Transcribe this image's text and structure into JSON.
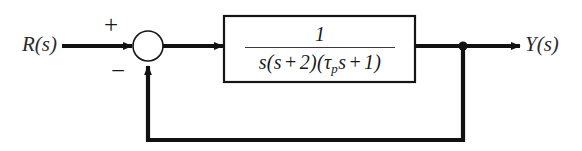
{
  "diagram": {
    "background_color": "#ffffff",
    "line_color": "#111111",
    "input": {
      "label": "R(s)"
    },
    "output": {
      "label": "Y(s)"
    },
    "summing_junction": {
      "shape": "circle",
      "plus_sign": "+",
      "minus_sign": "−",
      "plus_input": "R(s)",
      "minus_input": "feedback"
    },
    "plant_block": {
      "numerator": "1",
      "denominator_parts": {
        "factor1": "s",
        "open1": "(",
        "factor2_s": "s",
        "op1": "+",
        "factor2_const": "2",
        "close1": ")",
        "open2": "(",
        "tau": "τ",
        "tau_subscript": "p",
        "tau_s": "s",
        "op2": "+",
        "factor3_const": "1",
        "close2": ")"
      },
      "denominator_text": "s(s + 2)(τps + 1)",
      "transfer_function": "1 / [s(s + 2)(τ_p s + 1)]"
    },
    "feedback_path": {
      "type": "unity",
      "gain": "1",
      "takeoff_label": "takeoff node"
    }
  }
}
